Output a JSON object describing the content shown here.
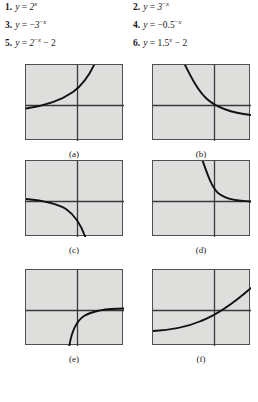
{
  "exercises": [
    {
      "number": "1.",
      "lhs": "y",
      "eq": "=",
      "expr_html": "2<sup class=\"exp\">x</sup>",
      "expr_text": "y = 2^x",
      "column": "left",
      "row": 0
    },
    {
      "number": "2.",
      "lhs": "y",
      "eq": "=",
      "expr_html": "3<sup class=\"exp\"><span class=\"op\">&#8722;</span>x</sup>",
      "expr_text": "y = 3^(-x)",
      "column": "right",
      "row": 0
    },
    {
      "number": "3.",
      "lhs": "y",
      "eq": "=",
      "expr_html": "<span class=\"op\">&#8722;</span>3<sup class=\"exp\"><span class=\"op\">&#8722;</span>x</sup>",
      "expr_text": "y = -3^(-x)",
      "column": "left",
      "row": 1
    },
    {
      "number": "4.",
      "lhs": "y",
      "eq": "=",
      "expr_html": "<span class=\"op\">&#8722;</span><span class=\"num\">0.5</span><sup class=\"exp\"><span class=\"op\">&#8722;</span>x</sup>",
      "expr_text": "y = -0.5^(-x)",
      "column": "right",
      "row": 1
    },
    {
      "number": "5.",
      "lhs": "y",
      "eq": "=",
      "expr_html": "2<sup class=\"exp\"><span class=\"op\">&#8722;</span>x</sup> <span class=\"op\">&#8722;</span> <span class=\"num\">2</span>",
      "expr_text": "y = 2^(-x) - 2",
      "column": "left",
      "row": 2
    },
    {
      "number": "6.",
      "lhs": "y",
      "eq": "=",
      "expr_html": "<span class=\"num\">1.5</span><sup class=\"exp\">x</sup> <span class=\"op\">&#8722;</span> <span class=\"num\">2</span>",
      "expr_text": "y = 1.5^x - 2",
      "column": "right",
      "row": 2
    }
  ],
  "figures": [
    {
      "label": "(a)",
      "column": 0,
      "row": 0,
      "description": "increasing exponential growth curve rising steeply through upper right quadrant",
      "axis_x_frac": 0.52,
      "axis_y_frac": 0.52,
      "curve_path": "M 0 43.5 C 18 41 34 36 47 27 C 58 19 64 9 69 -2"
    },
    {
      "label": "(b)",
      "column": 1,
      "row": 0,
      "description": "decreasing exponential decay curve falling from top left toward horizontal asymptote at right",
      "axis_x_frac": 0.62,
      "axis_y_frac": 0.52,
      "curve_path": "M 31 -2 C 38 12 45 26 54 34 C 64 43 80 48 98 50"
    },
    {
      "label": "(c)",
      "column": 0,
      "row": 1,
      "description": "reflected exponential curve approaching axis from left then descending steeply below horizontal axis",
      "axis_x_frac": 0.52,
      "axis_y_frac": 0.52,
      "curve_path": "M 0 38 C 16 39.5 30 42 40 48 C 50 55 56 66 60 78"
    },
    {
      "label": "(d)",
      "column": 1,
      "row": 1,
      "description": "steep exponential decay curve dropping from top and leveling onto horizontal axis at right",
      "axis_x_frac": 0.62,
      "axis_y_frac": 0.52,
      "curve_path": "M 49 -2 C 54 12 58 25 65 32 C 74 39 86 40 98 40.5"
    },
    {
      "label": "(e)",
      "column": 0,
      "row": 2,
      "description": "curve rising from bottom crossing the horizontal axis then flattening toward the right",
      "axis_x_frac": 0.52,
      "axis_y_frac": 0.52,
      "curve_path": "M 43 78 C 45 64 49 52 58 46 C 68 40 82 38.5 98 38.5"
    },
    {
      "label": "(f)",
      "column": 1,
      "row": 2,
      "description": "gradually rising exponential curve starting low at left and increasing through right side",
      "axis_x_frac": 0.62,
      "axis_y_frac": 0.52,
      "curve_path": "M 0 61 C 18 60 34 57 48 51 C 66 44 82 32 98 18"
    }
  ],
  "style": {
    "plot_fill": "#dededd",
    "plot_border": "#4f4f4f",
    "axis_color": "#3a3a3a",
    "curve_color": "#111111",
    "page_background": "#ffffff"
  }
}
